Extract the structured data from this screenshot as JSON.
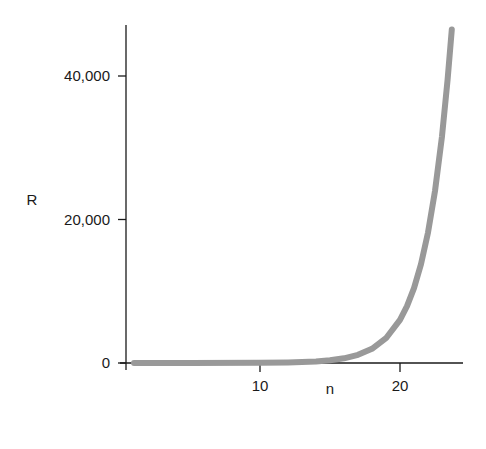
{
  "chart_data": {
    "type": "line",
    "title": "",
    "xlabel": "n",
    "ylabel": "R",
    "xlim": [
      0,
      24.5
    ],
    "ylim": [
      0,
      48000
    ],
    "grid": false,
    "legend": null,
    "x_ticks": [
      10,
      20
    ],
    "x_tick_labels": [
      "10",
      "20"
    ],
    "y_ticks": [
      0,
      20000,
      40000
    ],
    "y_tick_labels": [
      "0",
      "20,000",
      "40,000"
    ],
    "series": [
      {
        "name": "R",
        "color": "#999999",
        "x": [
          1,
          5,
          10,
          12,
          13,
          14,
          15,
          16,
          17,
          18,
          19,
          20,
          20.5,
          21,
          21.5,
          22,
          22.5,
          23,
          23.4,
          23.7
        ],
        "values": [
          0,
          2,
          24,
          71,
          124,
          216,
          377,
          655,
          1140,
          1980,
          3450,
          6000,
          7910,
          10440,
          13770,
          18170,
          23970,
          31600,
          39500,
          46500
        ]
      }
    ]
  }
}
